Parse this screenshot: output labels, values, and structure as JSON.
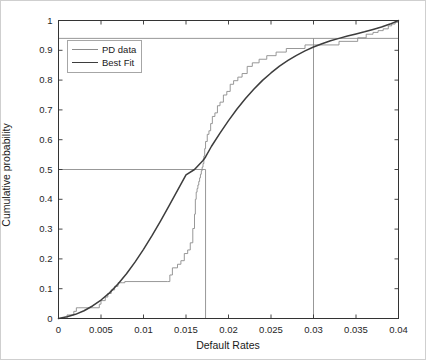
{
  "chart_data": {
    "type": "line",
    "title": "",
    "xlabel": "Default Rates",
    "ylabel": "Cumulative probability",
    "xlim": [
      0,
      0.04
    ],
    "ylim": [
      0,
      1
    ],
    "grid": false,
    "legend_position": "top-left",
    "xticks": [
      0,
      0.005,
      0.01,
      0.015,
      0.02,
      0.025,
      0.03,
      0.035,
      0.04
    ],
    "xtick_labels": [
      "0",
      "0.005",
      "0.01",
      "0.015",
      "0.02",
      "0.025",
      "0.03",
      "0.035",
      "0.04"
    ],
    "yticks": [
      0,
      0.1,
      0.2,
      0.3,
      0.4,
      0.5,
      0.6,
      0.7,
      0.8,
      0.9,
      1
    ],
    "ytick_labels": [
      "0",
      "0.1",
      "0.2",
      "0.3",
      "0.4",
      "0.5",
      "0.6",
      "0.7",
      "0.8",
      "0.9",
      "1"
    ],
    "series": [
      {
        "name": "PD data",
        "style": "step",
        "color": "#8c8c8c",
        "x": [
          0.0,
          0.001,
          0.0012,
          0.0018,
          0.0021,
          0.0024,
          0.0048,
          0.005,
          0.0055,
          0.0058,
          0.0062,
          0.0066,
          0.007,
          0.0072,
          0.0075,
          0.0078,
          0.0128,
          0.0131,
          0.0134,
          0.014,
          0.0144,
          0.0148,
          0.0152,
          0.0155,
          0.0158,
          0.016,
          0.0161,
          0.0162,
          0.0163,
          0.0164,
          0.0165,
          0.0166,
          0.0167,
          0.0168,
          0.0169,
          0.017,
          0.0171,
          0.0172,
          0.0173,
          0.0175,
          0.0177,
          0.0179,
          0.0181,
          0.0184,
          0.0187,
          0.019,
          0.0194,
          0.0198,
          0.0202,
          0.0206,
          0.0211,
          0.0216,
          0.0222,
          0.0228,
          0.0236,
          0.0245,
          0.0256,
          0.0268,
          0.029,
          0.033,
          0.0352,
          0.0362,
          0.037,
          0.0376,
          0.0382,
          0.0388,
          0.0392,
          0.0396,
          0.04
        ],
        "y": [
          0.0,
          0.012,
          0.012,
          0.024,
          0.036,
          0.036,
          0.048,
          0.06,
          0.072,
          0.084,
          0.096,
          0.108,
          0.12,
          0.12,
          0.12,
          0.124,
          0.124,
          0.146,
          0.17,
          0.182,
          0.194,
          0.218,
          0.23,
          0.254,
          0.302,
          0.35,
          0.4,
          0.424,
          0.436,
          0.448,
          0.46,
          0.472,
          0.484,
          0.496,
          0.508,
          0.52,
          0.545,
          0.57,
          0.594,
          0.618,
          0.63,
          0.654,
          0.678,
          0.69,
          0.714,
          0.726,
          0.75,
          0.762,
          0.786,
          0.798,
          0.81,
          0.822,
          0.846,
          0.858,
          0.87,
          0.882,
          0.894,
          0.906,
          0.918,
          0.93,
          0.942,
          0.954,
          0.96,
          0.966,
          0.972,
          0.982,
          0.988,
          0.994,
          1.0
        ]
      },
      {
        "name": "Best Fit",
        "style": "smooth",
        "color": "#3d3d3d",
        "distribution": "lognormal-like CDF",
        "x": [
          0.0,
          0.001,
          0.002,
          0.003,
          0.004,
          0.005,
          0.006,
          0.007,
          0.008,
          0.009,
          0.01,
          0.011,
          0.012,
          0.013,
          0.014,
          0.015,
          0.016,
          0.017,
          0.0173,
          0.018,
          0.019,
          0.02,
          0.021,
          0.022,
          0.023,
          0.024,
          0.025,
          0.026,
          0.027,
          0.028,
          0.029,
          0.03,
          0.031,
          0.032,
          0.033,
          0.034,
          0.035,
          0.036,
          0.037,
          0.038,
          0.039,
          0.04
        ],
        "y": [
          0.0,
          0.006,
          0.014,
          0.026,
          0.042,
          0.062,
          0.086,
          0.116,
          0.15,
          0.189,
          0.232,
          0.278,
          0.327,
          0.378,
          0.43,
          0.482,
          0.5,
          0.53,
          0.542,
          0.578,
          0.622,
          0.664,
          0.703,
          0.738,
          0.77,
          0.799,
          0.824,
          0.847,
          0.866,
          0.883,
          0.898,
          0.911,
          0.922,
          0.932,
          0.94,
          0.948,
          0.955,
          0.962,
          0.97,
          0.978,
          0.988,
          1.0
        ]
      }
    ],
    "reference_lines": [
      {
        "name": "horizontal-0.94",
        "orientation": "horizontal",
        "value": 0.94,
        "x_from": 0.0,
        "x_to": 0.04,
        "color": "#8c8c8c"
      },
      {
        "name": "horizontal-0.5",
        "orientation": "horizontal",
        "value": 0.5,
        "x_from": 0.0,
        "x_to": 0.0173,
        "color": "#8c8c8c"
      },
      {
        "name": "vertical-median",
        "orientation": "vertical",
        "value": 0.0173,
        "y_from": 0.0,
        "y_to": 0.5,
        "color": "#8c8c8c"
      },
      {
        "name": "vertical-0.03",
        "orientation": "vertical",
        "value": 0.03,
        "y_from": 0.0,
        "y_to": 0.94,
        "color": "#8c8c8c"
      }
    ],
    "legend": [
      {
        "label": "PD data",
        "color": "#8c8c8c",
        "width": 1
      },
      {
        "label": "Best Fit",
        "color": "#3d3d3d",
        "width": 1.6
      }
    ]
  }
}
